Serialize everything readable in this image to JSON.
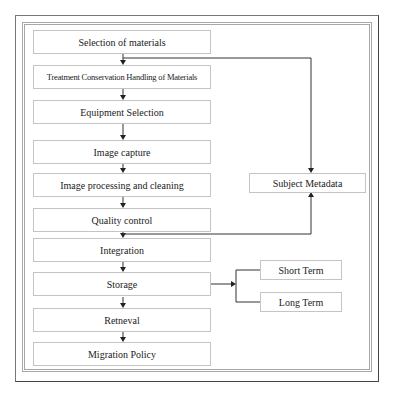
{
  "diagram": {
    "type": "flowchart",
    "main_steps": [
      "Selection of materials",
      "Treatment Conservation Handling  of Materials",
      "Equipment Selection",
      "Image capture",
      "Image processing and cleaning",
      "Quality control",
      "Integration",
      "Storage",
      "Retneval",
      "Migration Policy"
    ],
    "side_nodes": {
      "subject_metadata": "Subject Metadata",
      "short_term": "Short Term",
      "long_term": "Long Term"
    },
    "edges": [
      {
        "from": "Selection of materials",
        "to": "Treatment Conservation Handling  of Materials"
      },
      {
        "from": "Treatment Conservation Handling  of Materials",
        "to": "Equipment Selection"
      },
      {
        "from": "Equipment Selection",
        "to": "Image capture"
      },
      {
        "from": "Image capture",
        "to": "Image processing and cleaning"
      },
      {
        "from": "Image processing and cleaning",
        "to": "Quality control"
      },
      {
        "from": "Quality control",
        "to": "Integration"
      },
      {
        "from": "Integration",
        "to": "Storage"
      },
      {
        "from": "Storage",
        "to": "Retneval"
      },
      {
        "from": "Retneval",
        "to": "Migration Policy"
      },
      {
        "from": "Selection of materials",
        "to": "Subject Metadata"
      },
      {
        "from": "Quality control",
        "to": "Subject Metadata"
      },
      {
        "from": "Storage",
        "to": "Short Term"
      },
      {
        "from": "Storage",
        "to": "Long Term"
      }
    ]
  }
}
